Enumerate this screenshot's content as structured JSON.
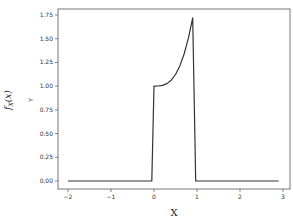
{
  "chart_data": {
    "type": "line",
    "title": "",
    "xlabel": "X",
    "ylabel": "Y",
    "outer_ylabel": "f_X(x)",
    "xlim": [
      -2.2,
      3.05
    ],
    "ylim": [
      -0.08,
      1.82
    ],
    "xticks": [
      -2,
      -1,
      0,
      1,
      2,
      3
    ],
    "xtick_labels": [
      "−2",
      "−1",
      "0",
      "1",
      "2",
      "3"
    ],
    "yticks": [
      0.0,
      0.25,
      0.5,
      0.75,
      1.0,
      1.25,
      1.5,
      1.75
    ],
    "ytick_labels": [
      "0.00",
      "0.25",
      "0.50",
      "0.75",
      "1.00",
      "1.25",
      "1.50",
      "1.75"
    ],
    "grid": false,
    "legend": null,
    "series": [
      {
        "name": "f_X(x)",
        "color": "#333333",
        "x": [
          -2.0,
          -0.05,
          0.0,
          0.1,
          0.2,
          0.3,
          0.4,
          0.5,
          0.6,
          0.7,
          0.8,
          0.9,
          0.97,
          2.9
        ],
        "y": [
          0.0,
          0.0,
          1.0,
          1.001,
          1.008,
          1.027,
          1.063,
          1.123,
          1.213,
          1.339,
          1.506,
          1.72,
          0.0,
          0.0
        ]
      }
    ]
  }
}
